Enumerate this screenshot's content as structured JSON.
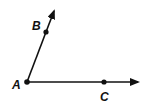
{
  "diagram": {
    "stroke_color": "#111111",
    "background": "#ffffff",
    "points": {
      "A": {
        "label": "A",
        "x": 27,
        "y": 82,
        "label_x": 12,
        "label_y": 89
      },
      "B": {
        "label": "B",
        "x": 46,
        "y": 32,
        "label_x": 32,
        "label_y": 30
      },
      "C": {
        "label": "C",
        "x": 104,
        "y": 82,
        "label_x": 100,
        "label_y": 101
      }
    },
    "rays": [
      {
        "name": "ray-AB",
        "from": "A",
        "through": "B",
        "tip_x": 54,
        "tip_y": 11
      },
      {
        "name": "ray-AC",
        "from": "A",
        "through": "C",
        "tip_x": 138,
        "tip_y": 82
      }
    ]
  }
}
